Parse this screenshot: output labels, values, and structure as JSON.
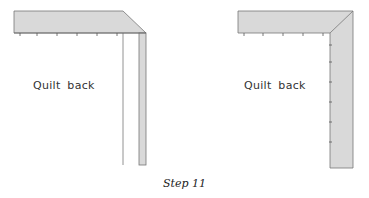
{
  "panels": [
    {
      "id": "left",
      "label": "Quilt  back"
    },
    {
      "id": "right",
      "label": "Quilt  back"
    }
  ],
  "caption": "Step 11",
  "colors": {
    "binding_fill": "#d9d9d9",
    "line": "#666666"
  }
}
